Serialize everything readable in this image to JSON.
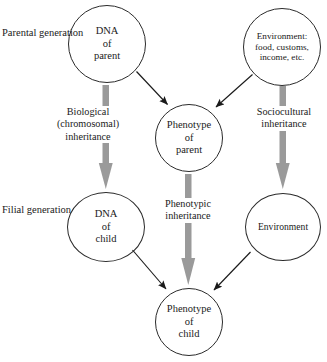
{
  "diagram": {
    "colors": {
      "node_stroke": "#2b2b2b",
      "thin_arrow": "#1a1a1a",
      "thick_arrow": "#9a9a9a",
      "background": "#ffffff"
    },
    "generations": [
      {
        "id": "parental",
        "line1": "Parental",
        "line2": "generation"
      },
      {
        "id": "filial",
        "line1": "Filial",
        "line2": "generation"
      }
    ],
    "nodes": [
      {
        "id": "dna-parent",
        "lines": [
          "DNA",
          "of",
          "parent"
        ]
      },
      {
        "id": "environment-parent",
        "lines": [
          "Environment:",
          "food, customs,",
          "income, etc."
        ]
      },
      {
        "id": "phenotype-parent",
        "lines": [
          "Phenotype",
          "of",
          "parent"
        ]
      },
      {
        "id": "dna-child",
        "lines": [
          "DNA",
          "of",
          "child"
        ]
      },
      {
        "id": "environment-child",
        "lines": [
          "Environment"
        ]
      },
      {
        "id": "phenotype-child",
        "lines": [
          "Phenotype",
          "of",
          "child"
        ]
      }
    ],
    "edge_labels": [
      {
        "id": "biological-inheritance",
        "lines": [
          "Biological",
          "(chromosomal)",
          "inheritance"
        ]
      },
      {
        "id": "sociocultural-inheritance",
        "lines": [
          "Sociocultural",
          "inheritance"
        ]
      },
      {
        "id": "phenotypic-inheritance",
        "lines": [
          "Phenotypic",
          "inheritance"
        ]
      }
    ],
    "edges": [
      {
        "id": "dna-parent-to-dna-child",
        "style": "thick-gray",
        "from": "dna-parent",
        "to": "dna-child"
      },
      {
        "id": "env-parent-to-env-child",
        "style": "thick-gray",
        "from": "environment-parent",
        "to": "environment-child"
      },
      {
        "id": "pheno-parent-to-pheno-child",
        "style": "thick-gray",
        "from": "phenotype-parent",
        "to": "phenotype-child"
      },
      {
        "id": "dna-parent-to-pheno-parent",
        "style": "thin-black",
        "from": "dna-parent",
        "to": "phenotype-parent"
      },
      {
        "id": "env-parent-to-pheno-parent",
        "style": "thin-black",
        "from": "environment-parent",
        "to": "phenotype-parent"
      },
      {
        "id": "dna-child-to-pheno-child",
        "style": "thin-black",
        "from": "dna-child",
        "to": "phenotype-child"
      },
      {
        "id": "env-child-to-pheno-child",
        "style": "thin-black",
        "from": "environment-child",
        "to": "phenotype-child"
      }
    ]
  }
}
